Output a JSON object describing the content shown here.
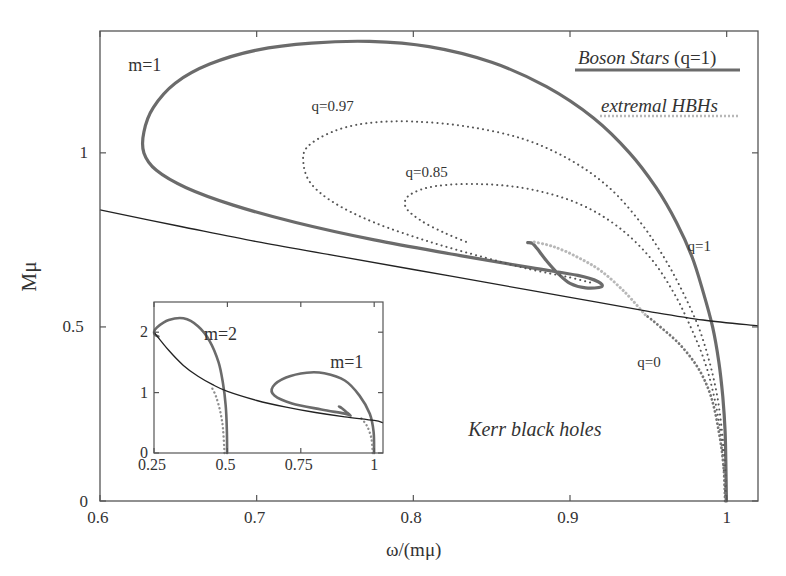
{
  "chart_data": {
    "type": "line",
    "title": "",
    "xlabel": "ω/(mμ)",
    "ylabel": "Mμ",
    "xlim": [
      0.6,
      1.02
    ],
    "ylim": [
      0,
      1.35
    ],
    "xticks": [
      {
        "v": 0.6,
        "label": "0.6"
      },
      {
        "v": 0.7,
        "label": "0.7"
      },
      {
        "v": 0.8,
        "label": "0.8"
      },
      {
        "v": 0.9,
        "label": "0.9"
      },
      {
        "v": 1.0,
        "label": "1"
      }
    ],
    "yticks": [
      {
        "v": 0,
        "label": "0"
      },
      {
        "v": 0.5,
        "label": "0.5"
      },
      {
        "v": 1.0,
        "label": "1"
      }
    ],
    "grid": false,
    "legend": {
      "position": "top-right",
      "entries": [
        {
          "label": "Boson Stars",
          "suffix": " (q=1)",
          "style": "solid-thick",
          "color": "#6b6b6b"
        },
        {
          "label": "extremal HBHs",
          "style": "dotted-light",
          "color": "#b8b8b8"
        }
      ]
    },
    "annotations": [
      {
        "text": "m=1",
        "x": 0.618,
        "y": 1.25,
        "italic": false
      },
      {
        "text": "q=0.97",
        "x": 0.735,
        "y": 1.13,
        "italic": false
      },
      {
        "text": "q=0.85",
        "x": 0.795,
        "y": 0.94,
        "italic": false
      },
      {
        "text": "q=1",
        "x": 0.975,
        "y": 0.73,
        "italic": false
      },
      {
        "text": "q=0",
        "x": 0.943,
        "y": 0.395,
        "italic": false
      },
      {
        "text": "Kerr black holes",
        "x": 0.835,
        "y": 0.205,
        "italic": true
      }
    ],
    "series": [
      {
        "name": "Boson Stars (q=1)",
        "style": "solid-thick",
        "color": "#6b6b6b",
        "points": [
          [
            0.9998,
            0.0
          ],
          [
            0.9995,
            0.1
          ],
          [
            0.999,
            0.2
          ],
          [
            0.9975,
            0.3
          ],
          [
            0.995,
            0.4
          ],
          [
            0.991,
            0.5
          ],
          [
            0.985,
            0.6
          ],
          [
            0.978,
            0.7
          ],
          [
            0.968,
            0.8
          ],
          [
            0.955,
            0.9
          ],
          [
            0.938,
            1.0
          ],
          [
            0.915,
            1.1
          ],
          [
            0.885,
            1.19
          ],
          [
            0.85,
            1.26
          ],
          [
            0.81,
            1.305
          ],
          [
            0.772,
            1.32
          ],
          [
            0.735,
            1.315
          ],
          [
            0.7,
            1.295
          ],
          [
            0.67,
            1.255
          ],
          [
            0.648,
            1.2
          ],
          [
            0.634,
            1.13
          ],
          [
            0.628,
            1.06
          ],
          [
            0.628,
            1.0
          ],
          [
            0.636,
            0.95
          ],
          [
            0.655,
            0.9
          ],
          [
            0.685,
            0.85
          ],
          [
            0.725,
            0.8
          ],
          [
            0.775,
            0.75
          ],
          [
            0.83,
            0.705
          ],
          [
            0.875,
            0.67
          ],
          [
            0.905,
            0.648
          ],
          [
            0.918,
            0.63
          ],
          [
            0.92,
            0.615
          ],
          [
            0.91,
            0.612
          ],
          [
            0.9,
            0.625
          ],
          [
            0.892,
            0.655
          ],
          [
            0.885,
            0.69
          ],
          [
            0.879,
            0.725
          ],
          [
            0.876,
            0.74
          ],
          [
            0.873,
            0.742
          ]
        ]
      },
      {
        "name": "q=0.97",
        "style": "dotted",
        "color": "#555555",
        "points": [
          [
            0.9995,
            0.0
          ],
          [
            0.999,
            0.1
          ],
          [
            0.997,
            0.2
          ],
          [
            0.994,
            0.3
          ],
          [
            0.989,
            0.4
          ],
          [
            0.982,
            0.5
          ],
          [
            0.972,
            0.6
          ],
          [
            0.96,
            0.7
          ],
          [
            0.945,
            0.8
          ],
          [
            0.925,
            0.9
          ],
          [
            0.9,
            0.98
          ],
          [
            0.87,
            1.04
          ],
          [
            0.835,
            1.075
          ],
          [
            0.8,
            1.09
          ],
          [
            0.77,
            1.085
          ],
          [
            0.748,
            1.06
          ],
          [
            0.732,
            1.015
          ],
          [
            0.73,
            0.965
          ],
          [
            0.735,
            0.91
          ],
          [
            0.75,
            0.855
          ],
          [
            0.775,
            0.8
          ],
          [
            0.81,
            0.745
          ],
          [
            0.845,
            0.7
          ],
          [
            0.875,
            0.665
          ],
          [
            0.9,
            0.642
          ],
          [
            0.915,
            0.625
          ]
        ]
      },
      {
        "name": "q=0.85",
        "style": "dotted",
        "color": "#555555",
        "points": [
          [
            0.9992,
            0.0
          ],
          [
            0.998,
            0.1
          ],
          [
            0.996,
            0.2
          ],
          [
            0.992,
            0.3
          ],
          [
            0.986,
            0.4
          ],
          [
            0.977,
            0.5
          ],
          [
            0.966,
            0.6
          ],
          [
            0.951,
            0.7
          ],
          [
            0.93,
            0.79
          ],
          [
            0.905,
            0.855
          ],
          [
            0.875,
            0.895
          ],
          [
            0.845,
            0.91
          ],
          [
            0.815,
            0.905
          ],
          [
            0.798,
            0.88
          ],
          [
            0.795,
            0.845
          ],
          [
            0.805,
            0.805
          ],
          [
            0.82,
            0.77
          ],
          [
            0.835,
            0.742
          ]
        ]
      },
      {
        "name": "q=0",
        "style": "dotted-thick",
        "color": "#777777",
        "points": [
          [
            0.999,
            0.0
          ],
          [
            0.998,
            0.1
          ],
          [
            0.995,
            0.2
          ],
          [
            0.99,
            0.3
          ],
          [
            0.982,
            0.38
          ],
          [
            0.97,
            0.45
          ],
          [
            0.955,
            0.51
          ],
          [
            0.948,
            0.535
          ]
        ]
      },
      {
        "name": "extremal HBHs",
        "style": "dotted-light",
        "color": "#b8b8b8",
        "points": [
          [
            0.948,
            0.535
          ],
          [
            0.935,
            0.6
          ],
          [
            0.92,
            0.66
          ],
          [
            0.905,
            0.7
          ],
          [
            0.89,
            0.73
          ],
          [
            0.876,
            0.745
          ]
        ]
      },
      {
        "name": "Kerr bound",
        "style": "solid-thin",
        "color": "#222222",
        "points": [
          [
            0.6,
            0.836
          ],
          [
            0.65,
            0.79
          ],
          [
            0.7,
            0.745
          ],
          [
            0.75,
            0.705
          ],
          [
            0.8,
            0.665
          ],
          [
            0.85,
            0.625
          ],
          [
            0.9,
            0.585
          ],
          [
            0.95,
            0.545
          ],
          [
            0.985,
            0.52
          ],
          [
            1.02,
            0.503
          ]
        ]
      }
    ],
    "inset": {
      "xlim": [
        0.25,
        1.03
      ],
      "ylim": [
        0,
        2.5
      ],
      "xticks": [
        {
          "v": 0.25,
          "label": "0.25"
        },
        {
          "v": 0.5,
          "label": "0.5"
        },
        {
          "v": 0.75,
          "label": "0.75"
        },
        {
          "v": 1.0,
          "label": "1"
        }
      ],
      "yticks": [
        {
          "v": 0,
          "label": "0"
        },
        {
          "v": 1,
          "label": "1"
        },
        {
          "v": 2,
          "label": "2"
        }
      ],
      "annotations": [
        {
          "text": "m=2",
          "x": 0.42,
          "y": 1.95
        },
        {
          "text": "m=1",
          "x": 0.85,
          "y": 1.5
        }
      ],
      "series": [
        {
          "name": "Boson Stars m=2",
          "style": "solid-thick",
          "color": "#6b6b6b",
          "points": [
            [
              0.499,
              0.0
            ],
            [
              0.498,
              0.4
            ],
            [
              0.494,
              0.8
            ],
            [
              0.485,
              1.15
            ],
            [
              0.47,
              1.5
            ],
            [
              0.44,
              1.85
            ],
            [
              0.4,
              2.1
            ],
            [
              0.35,
              2.23
            ],
            [
              0.3,
              2.2
            ],
            [
              0.26,
              2.08
            ],
            [
              0.25,
              2.0
            ],
            [
              0.255,
              1.95
            ],
            [
              0.265,
              1.93
            ]
          ]
        },
        {
          "name": "Boson Stars m=1",
          "style": "solid-thick",
          "color": "#6b6b6b",
          "points": [
            [
              0.9998,
              0.0
            ],
            [
              0.998,
              0.35
            ],
            [
              0.985,
              0.65
            ],
            [
              0.95,
              0.95
            ],
            [
              0.9,
              1.2
            ],
            [
              0.83,
              1.32
            ],
            [
              0.77,
              1.33
            ],
            [
              0.7,
              1.25
            ],
            [
              0.655,
              1.1
            ],
            [
              0.66,
              0.95
            ],
            [
              0.72,
              0.82
            ],
            [
              0.82,
              0.72
            ],
            [
              0.9,
              0.65
            ],
            [
              0.92,
              0.62
            ],
            [
              0.905,
              0.68
            ],
            [
              0.89,
              0.74
            ],
            [
              0.88,
              0.77
            ]
          ]
        },
        {
          "name": "extremal HBHs m=2",
          "style": "dotted-light",
          "color": "#8f8f8f",
          "points": [
            [
              0.49,
              0.0
            ],
            [
              0.485,
              0.4
            ],
            [
              0.475,
              0.7
            ],
            [
              0.46,
              0.95
            ],
            [
              0.445,
              1.1
            ]
          ]
        },
        {
          "name": "extremal HBHs m=1",
          "style": "dotted-light",
          "color": "#8f8f8f",
          "points": [
            [
              0.995,
              0.0
            ],
            [
              0.99,
              0.25
            ],
            [
              0.975,
              0.45
            ],
            [
              0.955,
              0.58
            ]
          ]
        },
        {
          "name": "Kerr bound",
          "style": "solid-thin",
          "color": "#222222",
          "points": [
            [
              0.25,
              2.0
            ],
            [
              0.3,
              1.7
            ],
            [
              0.35,
              1.45
            ],
            [
              0.4,
              1.27
            ],
            [
              0.45,
              1.13
            ],
            [
              0.5,
              1.02
            ],
            [
              0.6,
              0.87
            ],
            [
              0.7,
              0.76
            ],
            [
              0.8,
              0.67
            ],
            [
              0.9,
              0.6
            ],
            [
              1.0,
              0.54
            ],
            [
              1.03,
              0.5
            ]
          ]
        }
      ]
    }
  }
}
